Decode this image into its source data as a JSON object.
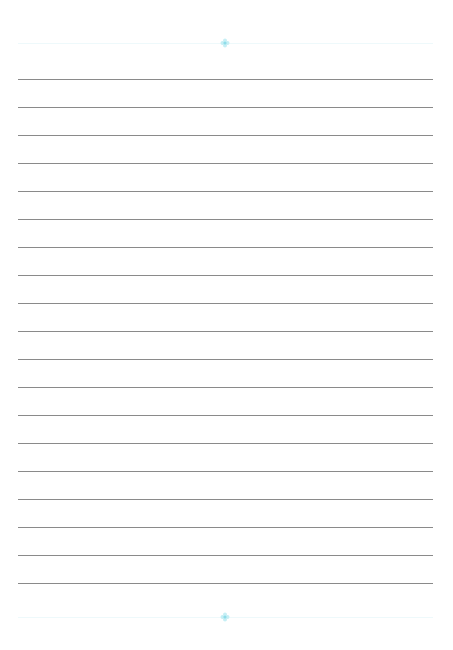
{
  "document": {
    "type": "lined-paper",
    "width": 453,
    "height": 650,
    "line_count": 19,
    "first_line_y": 79,
    "line_spacing": 28,
    "line_left": 18,
    "line_right": 433,
    "line_color": "#8a8a8a",
    "decoration": {
      "top": {
        "y": 43,
        "center_x": 225,
        "icon": "flower-ornament-icon",
        "color": "#9fe3ee"
      },
      "bottom": {
        "y": 617,
        "center_x": 225,
        "icon": "flower-ornament-icon",
        "color": "#9fe3ee"
      },
      "border_color": "#eef9fb"
    }
  }
}
